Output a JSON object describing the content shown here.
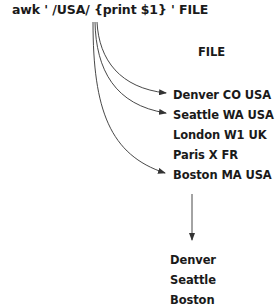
{
  "command": {
    "text": "awk ' /USA/ {print $1} ' FILE"
  },
  "input_file": {
    "label": "FILE",
    "records": [
      {
        "text": "Denver CO USA",
        "matched": true
      },
      {
        "text": "Seattle WA USA",
        "matched": true
      },
      {
        "text": "London W1 UK",
        "matched": false
      },
      {
        "text": "Paris X FR",
        "matched": false
      },
      {
        "text": "Boston MA USA",
        "matched": true
      }
    ]
  },
  "output": {
    "lines": [
      "Denver",
      "Seattle",
      "Boston"
    ]
  },
  "colors": {
    "text": "#1a1a1a",
    "lines": "#333333",
    "background": "#ffffff"
  }
}
